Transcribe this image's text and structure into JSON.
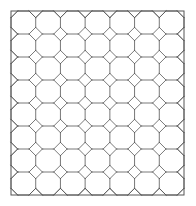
{
  "figure": {
    "background_color": "#ffffff",
    "line_color": "#555555",
    "border_color": "#555555",
    "line_width": 0.8,
    "border_width": 1.0
  },
  "frame": {
    "x": 11,
    "y": 11,
    "width": 173,
    "height": 184
  },
  "grid": {
    "columns": 7,
    "rows": 8,
    "cell_width": 24.714,
    "cell_height": 23.0,
    "corner_cut_ratio": 0.29,
    "vertical_line_count": 8,
    "horizontal_line_count": 9
  },
  "motifs": {
    "octagon_label": "octagon-tile",
    "diamond_label": "diamond-tile",
    "edge_half_diamond_label": "half-diamond-edge-tile",
    "corner_quarter_diamond_label": "quarter-diamond-corner-tile"
  },
  "chart_data": {
    "type": "table",
    "categories": [
      "columns",
      "rows",
      "cell_width_px",
      "cell_height_px",
      "corner_cut_px"
    ],
    "values": [
      7,
      8,
      24.714,
      23.0,
      6.9
    ],
    "xlabel": "",
    "ylabel": "",
    "ylim": [
      0,
      0
    ]
  }
}
